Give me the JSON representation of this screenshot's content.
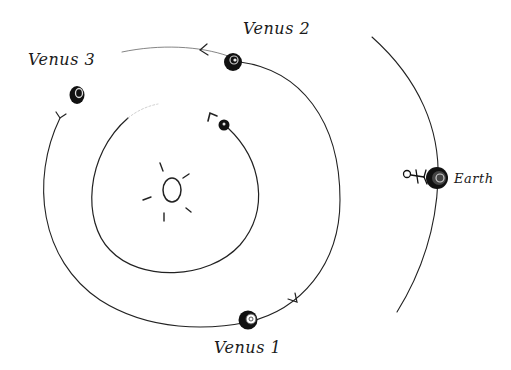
{
  "labels": {
    "venus1": "Venus 1",
    "venus2": "Venus 2",
    "venus3": "Venus 3",
    "earth": "Earth"
  },
  "bodies": [
    {
      "name": "Sun",
      "kind": "star"
    },
    {
      "name": "Inner planet",
      "kind": "planet"
    },
    {
      "name": "Venus 1",
      "kind": "planet"
    },
    {
      "name": "Venus 2",
      "kind": "planet"
    },
    {
      "name": "Venus 3",
      "kind": "planet"
    },
    {
      "name": "Earth",
      "kind": "planet"
    },
    {
      "name": "Observer",
      "kind": "stick-figure"
    }
  ],
  "orbits": [
    {
      "name": "inner-orbit",
      "direction": "counterclockwise"
    },
    {
      "name": "venus-orbit",
      "direction": "counterclockwise"
    },
    {
      "name": "earth-orbit"
    }
  ],
  "colors": {
    "ink": "#1a1a1a",
    "paper": "#ffffff"
  }
}
